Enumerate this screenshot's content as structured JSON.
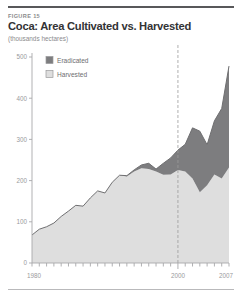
{
  "figure": {
    "label": "FIGURE 15",
    "title": "Coca: Area Cultivated vs. Harvested",
    "units": "(thousands hectares)"
  },
  "legend": [
    {
      "key": "eradicated",
      "label": "Eradicated",
      "color": "#7d7d7f",
      "swatch": "filled"
    },
    {
      "key": "harvested",
      "label": "Harvested",
      "color": "#dedede",
      "swatch": "outline"
    }
  ],
  "axes": {
    "y_ticks": [
      "0",
      "100",
      "200",
      "300",
      "400",
      "500"
    ],
    "x_ticks": [
      "1980",
      "2000",
      "2007"
    ],
    "marker_year": 2000
  },
  "chart_data": {
    "type": "area",
    "title": "Coca: Area Cultivated vs. Harvested",
    "subtitle": "(thousands hectares)",
    "xlabel": "",
    "ylabel": "thousands hectares",
    "ylim": [
      0,
      500
    ],
    "xlim": [
      1980,
      2007
    ],
    "ytick_values": [
      0,
      100,
      200,
      300,
      400,
      500
    ],
    "xtick_values": [
      1980,
      2000,
      2007
    ],
    "xtick_labels": [
      "1980",
      "2000",
      "2007"
    ],
    "grid": false,
    "legend_position": "upper-left-inside",
    "stacked": true,
    "annotations": [
      {
        "type": "vline",
        "x": 2000,
        "style": "dashed",
        "color": "#9a9a9c"
      }
    ],
    "x": [
      1980,
      1981,
      1982,
      1983,
      1984,
      1985,
      1986,
      1987,
      1988,
      1989,
      1990,
      1991,
      1992,
      1993,
      1994,
      1995,
      1996,
      1997,
      1998,
      1999,
      2000,
      2001,
      2002,
      2003,
      2004,
      2005,
      2006,
      2007
    ],
    "series": [
      {
        "name": "Harvested",
        "values": [
          68,
          82,
          88,
          97,
          113,
          126,
          140,
          138,
          158,
          175,
          170,
          196,
          213,
          210,
          222,
          230,
          228,
          222,
          214,
          215,
          226,
          222,
          205,
          172,
          189,
          215,
          205,
          232
        ]
      },
      {
        "name": "Eradicated",
        "values": [
          0,
          0,
          0,
          0,
          0,
          0,
          0,
          0,
          0,
          0,
          0,
          0,
          0,
          2,
          4,
          8,
          14,
          6,
          28,
          40,
          48,
          66,
          123,
          148,
          98,
          130,
          170,
          246
        ]
      }
    ],
    "totals": [
      68,
      82,
      88,
      97,
      113,
      126,
      140,
      138,
      158,
      175,
      170,
      196,
      213,
      212,
      226,
      238,
      242,
      228,
      242,
      255,
      274,
      288,
      328,
      320,
      287,
      345,
      375,
      478
    ]
  }
}
